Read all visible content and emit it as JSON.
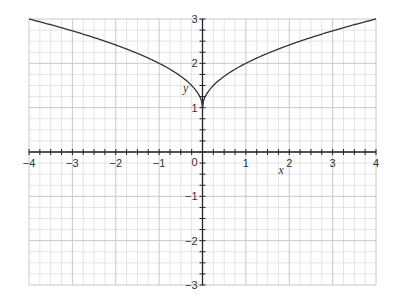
{
  "chart_data": {
    "type": "line",
    "title": "",
    "xlabel": "x",
    "ylabel": "y",
    "xlim": [
      -4,
      4
    ],
    "ylim": [
      -3,
      3
    ],
    "x_ticks": [
      -4,
      -3,
      -2,
      -1,
      0,
      1,
      2,
      3,
      4
    ],
    "y_ticks": [
      -3,
      -2,
      -1,
      0,
      1,
      2,
      3
    ],
    "x_tick_labels": [
      "−4",
      "−3",
      "−2",
      "−1",
      "0",
      "1",
      "2",
      "3",
      "4"
    ],
    "y_tick_labels": [
      "−3",
      "−2",
      "−1",
      "0",
      "1",
      "2",
      "3"
    ],
    "minor_step": 0.25,
    "grid": true,
    "series": [
      {
        "name": "y = 1 + sqrt(|x|)",
        "x": [
          -4,
          -3,
          -2,
          -1,
          -0.5,
          -0.25,
          0,
          0.25,
          0.5,
          1,
          2,
          3,
          4
        ],
        "y": [
          3,
          2.732,
          2.414,
          2,
          1.707,
          1.5,
          1,
          1.5,
          1.707,
          2,
          2.414,
          2.732,
          3
        ]
      }
    ],
    "colors": {
      "curve": "#333333",
      "axis": "#222222",
      "grid_major": "#c8c8c8",
      "grid_minor": "#e4e4e4"
    }
  }
}
